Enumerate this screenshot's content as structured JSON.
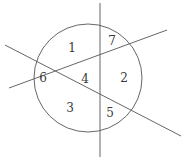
{
  "figure": {
    "canvas": {
      "width": 189,
      "height": 159,
      "background": "#ffffff"
    },
    "stroke_color": "#555555",
    "text_color": "#3a3a3a",
    "stroke_width": 0.9,
    "circle": {
      "name": "circle",
      "cx": 88,
      "cy": 78,
      "r": 54
    },
    "lines": [
      {
        "name": "vertical-line",
        "x1": 100,
        "y1": 3,
        "x2": 100,
        "y2": 157
      },
      {
        "name": "descending-secant-line",
        "x1": 5,
        "y1": 45,
        "x2": 181,
        "y2": 136
      },
      {
        "name": "ascending-secant-line",
        "x1": 9,
        "y1": 88,
        "x2": 167,
        "y2": 30
      }
    ],
    "region_labels": [
      {
        "name": "region-label-1",
        "text": "1",
        "x": 72,
        "y": 48
      },
      {
        "name": "region-label-7",
        "text": "7",
        "x": 112,
        "y": 41
      },
      {
        "name": "region-label-6",
        "text": "6",
        "x": 43,
        "y": 78
      },
      {
        "name": "region-label-4",
        "text": "4",
        "x": 85,
        "y": 79
      },
      {
        "name": "region-label-2",
        "text": "2",
        "x": 124,
        "y": 78
      },
      {
        "name": "region-label-3",
        "text": "3",
        "x": 70,
        "y": 108
      },
      {
        "name": "region-label-5",
        "text": "5",
        "x": 110,
        "y": 113
      }
    ]
  },
  "chart_data": {
    "type": "diagram",
    "regions": [
      "1",
      "2",
      "3",
      "4",
      "5",
      "6",
      "7"
    ],
    "region_count": 7,
    "shapes": [
      "circle",
      "vertical-line",
      "descending-secant-line",
      "ascending-secant-line"
    ]
  }
}
